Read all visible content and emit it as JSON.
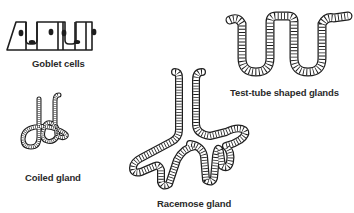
{
  "diagram": {
    "figures": [
      {
        "id": "goblet",
        "label": "Goblet cells"
      },
      {
        "id": "test_tube",
        "label": "Test-tube shaped glands"
      },
      {
        "id": "coiled",
        "label": "Coiled gland"
      },
      {
        "id": "racemose",
        "label": "Racemose gland"
      }
    ],
    "colors": {
      "ink": "#1e1e1e",
      "background": "#ffffff"
    }
  }
}
